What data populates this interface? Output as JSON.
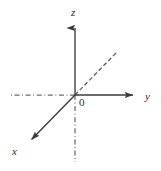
{
  "figure": {
    "kind": "3d-cartesian-axes-diagram",
    "width": 161,
    "height": 171,
    "background_color": "#ffffff",
    "line_color": "#3a3a3a",
    "dashed_line_color": "#6b6b6b",
    "text_color": "#2b2b2b",
    "stroke_width": 1.3,
    "origin": {
      "x": 75,
      "y": 95
    },
    "labels": {
      "z": "z",
      "y": "y",
      "x": "x",
      "origin": "0"
    },
    "axes": [
      {
        "name": "z-axis",
        "label": "z",
        "style": "solid",
        "arrow": true,
        "from": {
          "x": 75,
          "y": 95
        },
        "to": {
          "x": 75,
          "y": 21
        }
      },
      {
        "name": "z-axis-negative",
        "label": "",
        "style": "dash-dot",
        "arrow": false,
        "from": {
          "x": 75,
          "y": 95
        },
        "to": {
          "x": 75,
          "y": 162
        }
      },
      {
        "name": "y-axis",
        "label": "y",
        "style": "solid",
        "arrow": true,
        "from": {
          "x": 75,
          "y": 95
        },
        "to": {
          "x": 140,
          "y": 95
        }
      },
      {
        "name": "y-axis-negative",
        "label": "",
        "style": "dash-dot",
        "arrow": false,
        "from": {
          "x": 75,
          "y": 95
        },
        "to": {
          "x": 11,
          "y": 95
        }
      },
      {
        "name": "x-axis",
        "label": "x",
        "style": "solid",
        "arrow": true,
        "from": {
          "x": 75,
          "y": 95
        },
        "to": {
          "x": 26,
          "y": 145
        }
      },
      {
        "name": "x-axis-negative",
        "label": "",
        "style": "dashed",
        "arrow": false,
        "from": {
          "x": 75,
          "y": 95
        },
        "to": {
          "x": 117,
          "y": 52
        }
      }
    ]
  }
}
